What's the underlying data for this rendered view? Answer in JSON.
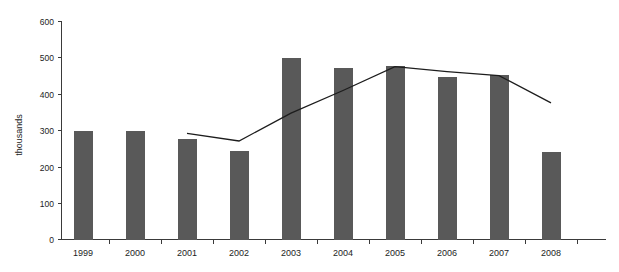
{
  "chart_data": {
    "type": "bar",
    "title": "",
    "subtitle": "",
    "xlabel": "",
    "ylabel": "thousands",
    "categories": [
      "1999",
      "2000",
      "2001",
      "2002",
      "2003",
      "2004",
      "2005",
      "2006",
      "2007",
      "2008"
    ],
    "ylim": [
      0,
      600
    ],
    "yticks": [
      0,
      100,
      200,
      300,
      400,
      500,
      600
    ],
    "ytick_labels": [
      "0",
      "100",
      "200",
      "300",
      "400",
      "500",
      "600"
    ],
    "grid": false,
    "legend": "none",
    "series": [
      {
        "name": "bars",
        "type": "bar",
        "color": "#595959",
        "values": [
          300,
          300,
          276,
          244,
          501,
          471,
          477,
          448,
          452,
          241
        ]
      },
      {
        "name": "trend-line",
        "type": "line",
        "color": "#1d1d1d",
        "x": [
          "2001",
          "2002",
          "2003",
          "2004",
          "2005",
          "2006",
          "2007",
          "2008"
        ],
        "values": [
          292,
          271,
          348,
          410,
          476,
          462,
          451,
          376
        ]
      }
    ]
  },
  "axis": {
    "y_title": "thousands",
    "y_labels": [
      "600",
      "500",
      "400",
      "300",
      "200",
      "100",
      "0"
    ],
    "x_labels": [
      "1999",
      "2000",
      "2001",
      "2002",
      "2003",
      "2004",
      "2005",
      "2006",
      "2007",
      "2008"
    ]
  },
  "colors": {
    "bar_fill": "#595959",
    "line_stroke": "#1d1d1d",
    "axis": "#3a3a3a",
    "background": "#ffffff",
    "text": "#1d1d1d"
  }
}
